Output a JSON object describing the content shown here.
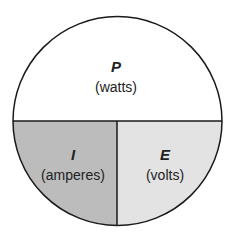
{
  "diagram": {
    "colors": {
      "top_fill": "#ffffff",
      "left_fill": "#bcbcbc",
      "right_fill": "#e3e3e3",
      "stroke": "#1a1a1a"
    },
    "sections": [
      {
        "id": "power",
        "symbol": "P",
        "unit": "(watts)"
      },
      {
        "id": "current",
        "symbol": "I",
        "unit": "(amperes)"
      },
      {
        "id": "voltage",
        "symbol": "E",
        "unit": "(volts)"
      }
    ]
  }
}
